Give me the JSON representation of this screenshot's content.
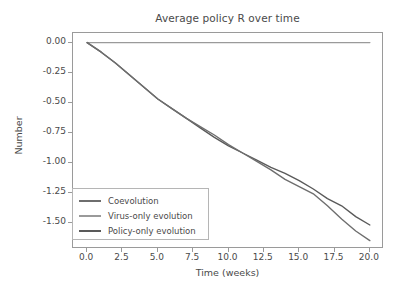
{
  "chart_data": {
    "type": "line",
    "title": "Average policy R over time",
    "xlabel": "Time (weeks)",
    "ylabel": "Number",
    "xlim": [
      -1.0,
      21.0
    ],
    "ylim": [
      -1.72,
      0.08
    ],
    "grid": false,
    "legend_position": "lower left",
    "xticks": [
      "0.0",
      "2.5",
      "5.0",
      "7.5",
      "10.0",
      "12.5",
      "15.0",
      "17.5",
      "20.0"
    ],
    "xtick_values": [
      0.0,
      2.5,
      5.0,
      7.5,
      10.0,
      12.5,
      15.0,
      17.5,
      20.0
    ],
    "yticks": [
      "0.00",
      "-0.25",
      "-0.50",
      "-0.75",
      "-1.00",
      "-1.25",
      "-1.50"
    ],
    "ytick_values": [
      0.0,
      -0.25,
      -0.5,
      -0.75,
      -1.0,
      -1.25,
      -1.5
    ],
    "x": [
      0,
      1,
      2,
      3,
      4,
      5,
      6,
      7,
      8,
      9,
      10,
      11,
      12,
      13,
      14,
      15,
      16,
      17,
      18,
      19,
      20
    ],
    "series": [
      {
        "name": "Coevolution",
        "color": "#6e6e6e",
        "values": [
          0.0,
          -0.08,
          -0.17,
          -0.27,
          -0.37,
          -0.47,
          -0.55,
          -0.63,
          -0.7,
          -0.77,
          -0.85,
          -0.92,
          -0.99,
          -1.06,
          -1.14,
          -1.2,
          -1.26,
          -1.36,
          -1.47,
          -1.57,
          -1.65
        ]
      },
      {
        "name": "Virus-only evolution",
        "color": "#9a9a9a",
        "values": [
          0.0,
          0.0,
          0.0,
          0.0,
          0.0,
          0.0,
          0.0,
          0.0,
          0.0,
          0.0,
          0.0,
          0.0,
          0.0,
          0.0,
          0.0,
          0.0,
          0.0,
          0.0,
          0.0,
          0.0,
          0.0
        ]
      },
      {
        "name": "Policy-only evolution",
        "color": "#5a5a5a",
        "values": [
          0.0,
          -0.08,
          -0.17,
          -0.27,
          -0.37,
          -0.47,
          -0.55,
          -0.63,
          -0.71,
          -0.79,
          -0.86,
          -0.92,
          -0.98,
          -1.04,
          -1.09,
          -1.15,
          -1.22,
          -1.3,
          -1.36,
          -1.45,
          -1.52
        ]
      }
    ]
  },
  "axes": {
    "title": "Average policy R over time",
    "xlabel": "Time (weeks)",
    "ylabel": "Number"
  }
}
